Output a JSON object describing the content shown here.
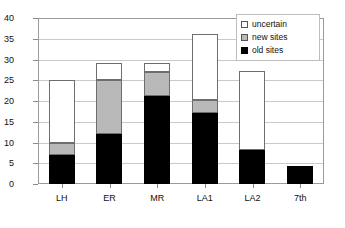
{
  "chart_data": {
    "type": "bar",
    "stacked": true,
    "title": "",
    "subtitle": "",
    "xlabel": "",
    "ylabel": "",
    "categories": [
      "LH",
      "ER",
      "MR",
      "LA1",
      "LA2",
      "7th"
    ],
    "series": [
      {
        "name": "old sites",
        "color": "#000000",
        "values": [
          7.0,
          12.0,
          21.2,
          17.2,
          8.2,
          4.3
        ]
      },
      {
        "name": "new sites",
        "color": "#b9b9b9",
        "values": [
          3.0,
          13.0,
          5.8,
          3.0,
          0,
          0
        ]
      },
      {
        "name": "uncertain",
        "color": "#ffffff",
        "values": [
          15.0,
          4.2,
          2.2,
          16.0,
          19.0,
          0
        ]
      }
    ],
    "totals": [
      25.0,
      29.2,
      29.2,
      36.2,
      27.2,
      4.3
    ],
    "ylim": [
      0,
      40
    ],
    "ytick_step": 5,
    "yticks": [
      "0",
      "5",
      "10",
      "15",
      "20",
      "25",
      "30",
      "35",
      "40"
    ],
    "grid": true,
    "legend_position": "top-right",
    "legend_order": [
      "uncertain",
      "new sites",
      "old sites"
    ]
  },
  "legend": {
    "entries": [
      {
        "label": "uncertain",
        "icon": "square-white-swatch"
      },
      {
        "label": "new sites",
        "icon": "square-gray-swatch"
      },
      {
        "label": "old sites",
        "icon": "square-black-swatch"
      }
    ]
  },
  "colors": {
    "old_sites": "#000000",
    "new_sites": "#b9b9b9",
    "uncertain": "#ffffff",
    "grid": "#c9c9c9",
    "axis": "#9a9a9a",
    "text": "#111111"
  }
}
